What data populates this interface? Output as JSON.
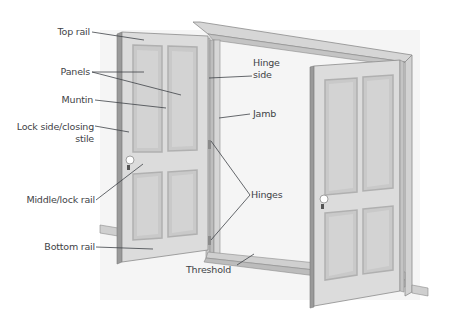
{
  "diagram": {
    "colors": {
      "door_face": "#dcdcdc",
      "door_panel": "#c9c9c9",
      "panel_border": "#b3b3b3",
      "door_edge": "#9a9a9a",
      "frame": "#d4d4d4",
      "frame_edge": "#8c8c8c",
      "wall_shadow": "#f0f0f0",
      "label_text": "#3f4347",
      "leader_line": "#3f4347"
    },
    "labels": {
      "top_rail": "Top rail",
      "panels": "Panels",
      "muntin": "Muntin",
      "lock_stile_line1": "Lock side/closing",
      "lock_stile_line2": "stile",
      "middle_rail": "Middle/lock rail",
      "bottom_rail": "Bottom rail",
      "hinge_side_line1": "Hinge",
      "hinge_side_line2": "side",
      "jamb": "Jamb",
      "hinges": "Hinges",
      "threshold": "Threshold"
    }
  }
}
